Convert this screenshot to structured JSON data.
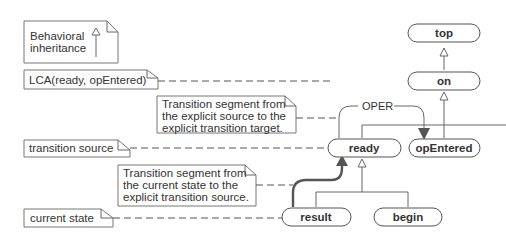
{
  "notes": {
    "legend": {
      "line1": "Behavioral",
      "line2": "inheritance"
    },
    "lca": "LCA(ready, opEntered)",
    "seg_explicit": {
      "line1": "Transition segment from",
      "line2": "the explicit source to the",
      "line3": "explicit transition target."
    },
    "transition_source": "transition source",
    "seg_current": {
      "line1": "Transition segment from",
      "line2": "the current state to the",
      "line3": "explicit transition source."
    },
    "current_state": "current state"
  },
  "states": {
    "top": "top",
    "on": "on",
    "ready": "ready",
    "opEntered": "opEntered",
    "result": "result",
    "begin": "begin"
  },
  "transition": {
    "label": "OPER"
  }
}
